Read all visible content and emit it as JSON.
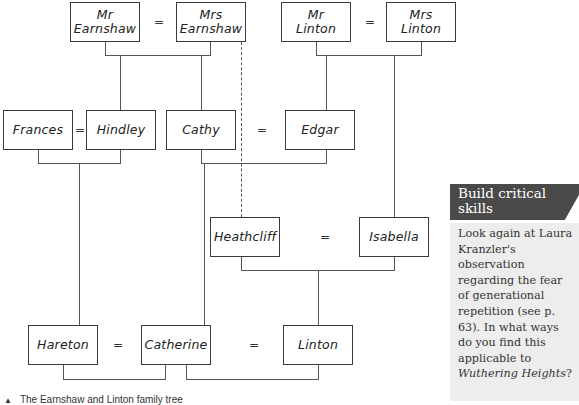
{
  "tree": {
    "people": {
      "mr_earnshaw": "Mr\nEarnshaw",
      "mrs_earnshaw": "Mrs\nEarnshaw",
      "mr_linton": "Mr\nLinton",
      "mrs_linton": "Mrs\nLinton",
      "frances": "Frances",
      "hindley": "Hindley",
      "cathy": "Cathy",
      "edgar": "Edgar",
      "heathcliff": "Heathcliff",
      "isabella": "Isabella",
      "hareton": "Hareton",
      "catherine": "Catherine",
      "linton": "Linton"
    },
    "marriage_symbol": "=",
    "relationships": [
      {
        "type": "marriage",
        "a": "Mr Earnshaw",
        "b": "Mrs Earnshaw"
      },
      {
        "type": "marriage",
        "a": "Mr Linton",
        "b": "Mrs Linton"
      },
      {
        "type": "children",
        "parents": [
          "Mr Earnshaw",
          "Mrs Earnshaw"
        ],
        "children": [
          "Hindley",
          "Cathy"
        ]
      },
      {
        "type": "children",
        "parents": [
          "Mr Linton",
          "Mrs Linton"
        ],
        "children": [
          "Edgar",
          "Isabella"
        ]
      },
      {
        "type": "adopted",
        "parents": [
          "Mr Earnshaw",
          "Mrs Earnshaw"
        ],
        "child": "Heathcliff",
        "style": "dashed"
      },
      {
        "type": "marriage",
        "a": "Frances",
        "b": "Hindley"
      },
      {
        "type": "marriage",
        "a": "Cathy",
        "b": "Edgar"
      },
      {
        "type": "marriage",
        "a": "Heathcliff",
        "b": "Isabella"
      },
      {
        "type": "children",
        "parents": [
          "Frances",
          "Hindley"
        ],
        "children": [
          "Hareton"
        ]
      },
      {
        "type": "children",
        "parents": [
          "Cathy",
          "Edgar"
        ],
        "children": [
          "Catherine"
        ]
      },
      {
        "type": "children",
        "parents": [
          "Heathcliff",
          "Isabella"
        ],
        "children": [
          "Linton"
        ]
      },
      {
        "type": "marriage",
        "a": "Hareton",
        "b": "Catherine"
      },
      {
        "type": "marriage",
        "a": "Catherine",
        "b": "Linton"
      }
    ],
    "caption_marker": "▲",
    "caption": "The Earnshaw and Linton family tree"
  },
  "sidebar": {
    "title": "Build critical skills",
    "body_before": "Look again at Laura Kranzler's observation regarding the fear of generational repetition (see p. 63). In what ways do you find this applicable to ",
    "body_italic": "Wuthering Heights",
    "body_after": "?"
  }
}
